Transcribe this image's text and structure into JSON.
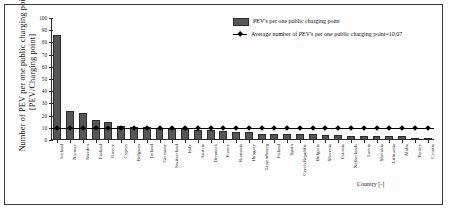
{
  "chart_data": {
    "type": "bar",
    "title": "",
    "xlabel": "Country [-]",
    "ylabel": "Number of PEV per one public charging point [PEV/Charging point]",
    "ylabel_line1": "Number of PEV per one public charging point",
    "ylabel_line2": "[PEV/Charging point]",
    "ylim": [
      0,
      100
    ],
    "yticks": [
      0,
      10,
      20,
      30,
      40,
      50,
      60,
      70,
      80,
      90,
      100
    ],
    "grid": false,
    "legend_position": "top-right",
    "categories": [
      "Iceland",
      "Norway",
      "Sweden",
      "Finland",
      "Greece",
      "Cyprus",
      "Belgium",
      "Ireland",
      "Germany",
      "Switzerland",
      "Italy",
      "Austria",
      "Denmark",
      "France",
      "Romania",
      "Hungary",
      "Luxembourg",
      "Poland",
      "Spain",
      "Czech Republic",
      "Bulgaria",
      "Slovenia",
      "Estonia",
      "Netherlands",
      "Latvia",
      "Slovakia",
      "Lithuania",
      "Malta",
      "Turkey",
      "Croatia"
    ],
    "series": [
      {
        "name": "PEV's per one public charging point",
        "type": "bar",
        "color": "#565656",
        "values": [
          86.0,
          24.0,
          22.0,
          16.5,
          15.0,
          11.5,
          11.0,
          10.5,
          10.0,
          9.2,
          9.0,
          8.6,
          8.5,
          7.0,
          6.9,
          6.8,
          5.2,
          5.1,
          5.0,
          5.0,
          5.2,
          4.0,
          4.0,
          3.4,
          3.2,
          3.2,
          3.2,
          3.2,
          2.0,
          1.4
        ]
      },
      {
        "name": "Average number of PEV's per one public charging point=10.07",
        "type": "line",
        "color": "#000000",
        "marker": "diamond",
        "value": 10.07
      }
    ],
    "legend": [
      {
        "marker": "bar-swatch",
        "label": "PEV's per one public charging point"
      },
      {
        "marker": "line-diamond",
        "label": "Average number of PEV's per one public charging point=10.07"
      }
    ]
  }
}
